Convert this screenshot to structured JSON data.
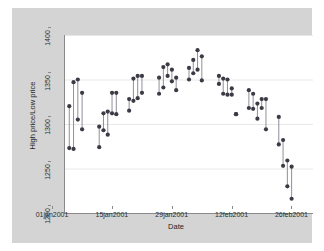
{
  "chart_data": {
    "type": "scatter",
    "title": "",
    "subtitle": "",
    "xlabel": "Date",
    "ylabel": "High price/Low price",
    "grid": true,
    "legend": false,
    "legend_position": "none",
    "style": "stata-range-spike",
    "marker_color": "#3b3b46",
    "line_color": "#8f8f9a",
    "grid_color": "#e8e8e8",
    "plot_background": "#ffffff",
    "graph_background": "#d4d4d4",
    "axis_color": "#8a8a8a",
    "ylim": [
      1200,
      1400
    ],
    "yticks": [
      1200,
      1250,
      1300,
      1350,
      1400
    ],
    "ytick_labels": [
      "1200",
      "1250",
      "1300",
      "1350",
      "1400"
    ],
    "xlim": [
      "01jan2001",
      "28feb2001"
    ],
    "xticks": [
      "01jan2001",
      "15jan2001",
      "29jan2001",
      "12feb2001",
      "26feb2001"
    ],
    "xtick_labels": [
      "01jan2001",
      "15jan2001",
      "29jan2001",
      "12feb2001",
      "26feb2001"
    ],
    "xtick_days": [
      0,
      14,
      28,
      42,
      56
    ],
    "series": [
      {
        "name": "High price",
        "key": "high"
      },
      {
        "name": "Low price",
        "key": "low"
      }
    ],
    "points": [
      {
        "day": 1,
        "low": 1273,
        "high": 1320
      },
      {
        "day": 2,
        "low": 1272,
        "high": 1347
      },
      {
        "day": 3,
        "low": 1305,
        "high": 1350
      },
      {
        "day": 4,
        "low": 1294,
        "high": 1335
      },
      {
        "day": 8,
        "low": 1274,
        "high": 1297
      },
      {
        "day": 9,
        "low": 1293,
        "high": 1312
      },
      {
        "day": 10,
        "low": 1288,
        "high": 1314
      },
      {
        "day": 11,
        "low": 1312,
        "high": 1335
      },
      {
        "day": 12,
        "low": 1311,
        "high": 1335
      },
      {
        "day": 15,
        "low": 1315,
        "high": 1328
      },
      {
        "day": 16,
        "low": 1326,
        "high": 1351
      },
      {
        "day": 17,
        "low": 1329,
        "high": 1354
      },
      {
        "day": 18,
        "low": 1335,
        "high": 1354
      },
      {
        "day": 22,
        "low": 1334,
        "high": 1352
      },
      {
        "day": 23,
        "low": 1341,
        "high": 1364
      },
      {
        "day": 24,
        "low": 1354,
        "high": 1367
      },
      {
        "day": 25,
        "low": 1348,
        "high": 1361
      },
      {
        "day": 26,
        "low": 1338,
        "high": 1352
      },
      {
        "day": 29,
        "low": 1350,
        "high": 1363
      },
      {
        "day": 30,
        "low": 1357,
        "high": 1372
      },
      {
        "day": 31,
        "low": 1361,
        "high": 1383
      },
      {
        "day": 32,
        "low": 1349,
        "high": 1376
      },
      {
        "day": 36,
        "low": 1345,
        "high": 1354
      },
      {
        "day": 37,
        "low": 1334,
        "high": 1351
      },
      {
        "day": 38,
        "low": 1333,
        "high": 1350
      },
      {
        "day": 39,
        "low": 1333,
        "high": 1340
      },
      {
        "day": 40,
        "low": 1311,
        "high": 1311
      },
      {
        "day": 43,
        "low": 1318,
        "high": 1338
      },
      {
        "day": 44,
        "low": 1317,
        "high": 1334
      },
      {
        "day": 45,
        "low": 1306,
        "high": 1323
      },
      {
        "day": 46,
        "low": 1318,
        "high": 1328
      },
      {
        "day": 47,
        "low": 1294,
        "high": 1328
      },
      {
        "day": 50,
        "low": 1277,
        "high": 1308
      },
      {
        "day": 51,
        "low": 1253,
        "high": 1282
      },
      {
        "day": 52,
        "low": 1230,
        "high": 1259
      },
      {
        "day": 53,
        "low": 1216,
        "high": 1252
      }
    ]
  }
}
